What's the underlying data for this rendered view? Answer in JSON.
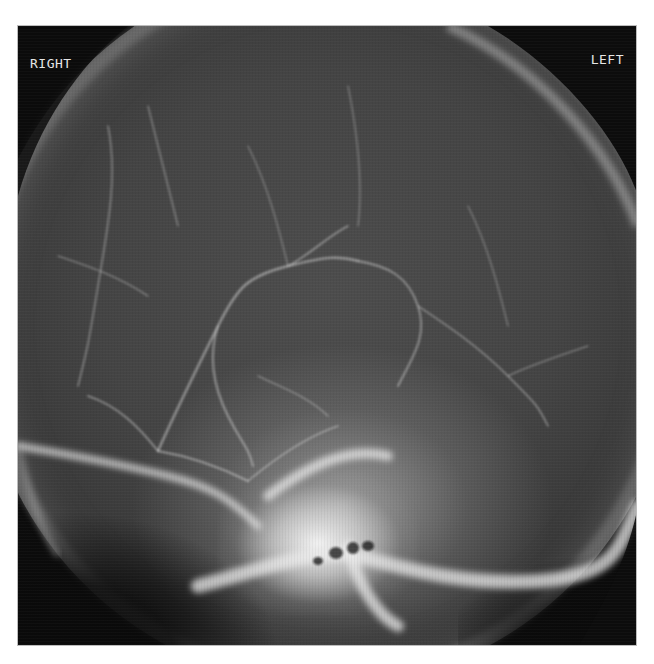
{
  "image": {
    "description": "Cerebral angiogram X-ray of the skull showing contrast-filled blood vessels",
    "orientation_labels": {
      "right": "RIGHT",
      "left": "LEFT"
    },
    "colors": {
      "background": "#ffffff",
      "film_black": "#0c0c0c",
      "skull_gray": "#444444",
      "bone_white": "#f0f0f0",
      "label_text": "#e6e6e6"
    }
  }
}
